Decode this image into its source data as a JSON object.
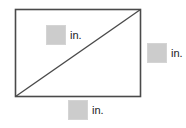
{
  "figure": {
    "width_px": 186,
    "height_px": 128,
    "background_color": "#ffffff",
    "stroke_color": "#4a4a4a",
    "box_fill_color": "#cccccc",
    "text_color": "#1a1a1a"
  },
  "shape": {
    "type": "rectangle-with-diagonal",
    "rect": {
      "x": 15,
      "y": 9,
      "width": 126,
      "height": 88
    },
    "diagonal": {
      "x1": 15,
      "y1": 97,
      "x2": 141,
      "y2": 9
    }
  },
  "measurements": [
    {
      "id": "width",
      "value": "",
      "unit": "in.",
      "position": "inside-top-left",
      "description": "rectangle width measurement"
    },
    {
      "id": "height",
      "value": "",
      "unit": "in.",
      "position": "outside-right",
      "description": "rectangle height measurement"
    },
    {
      "id": "diagonal",
      "value": "",
      "unit": "in.",
      "position": "outside-bottom",
      "description": "rectangle diagonal measurement"
    }
  ]
}
